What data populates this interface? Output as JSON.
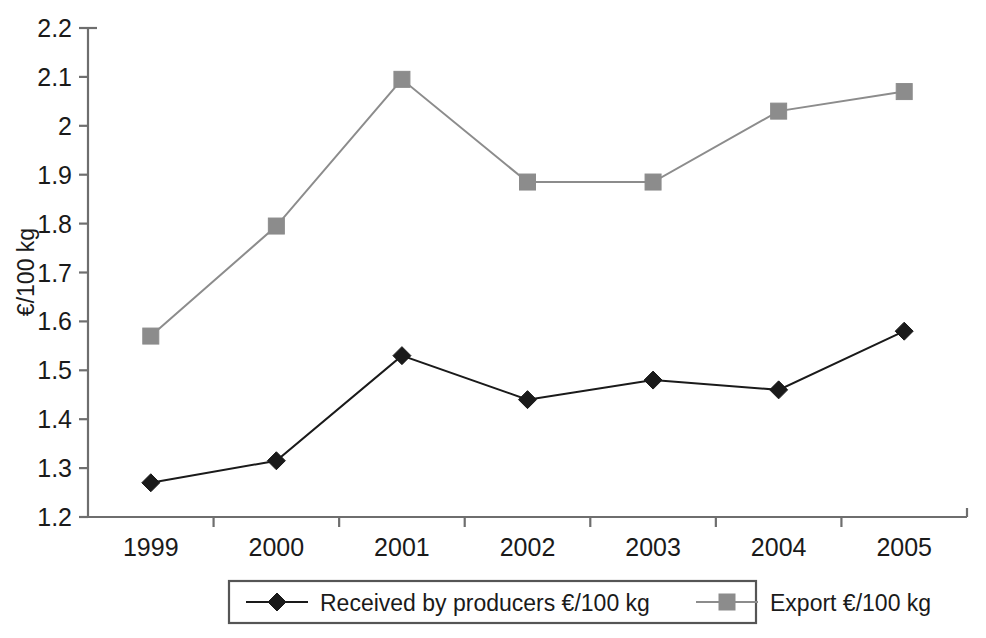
{
  "chart_data": {
    "type": "line",
    "title": "",
    "subtitle": "",
    "xlabel": "",
    "ylabel": "€/100 kg",
    "categories": [
      "1999",
      "2000",
      "2001",
      "2002",
      "2003",
      "2004",
      "2005"
    ],
    "ylim": [
      1.2,
      2.2
    ],
    "yticks": [
      "1.2",
      "1.3",
      "1.4",
      "1.5",
      "1.6",
      "1.7",
      "1.8",
      "1.9",
      "2",
      "2.1",
      "2.2"
    ],
    "ytick_values": [
      1.2,
      1.3,
      1.4,
      1.5,
      1.6,
      1.7,
      1.8,
      1.9,
      2.0,
      2.1,
      2.2
    ],
    "grid": false,
    "legend_position": "bottom",
    "series": [
      {
        "name": "Received by producers €/100 kg",
        "marker": "diamond",
        "color": "#1a1a1a",
        "values": [
          1.27,
          1.315,
          1.53,
          1.44,
          1.48,
          1.46,
          1.58
        ]
      },
      {
        "name": "Export €/100 kg",
        "marker": "square",
        "color": "#8c8c8c",
        "values": [
          1.57,
          1.795,
          2.095,
          1.885,
          1.885,
          2.03,
          2.07
        ]
      }
    ]
  },
  "legend": {
    "items": [
      {
        "label": "Received by producers €/100 kg",
        "marker": "diamond-marker",
        "color": "#1a1a1a"
      },
      {
        "label": "Export €/100 kg",
        "marker": "square-marker",
        "color": "#8c8c8c"
      }
    ]
  },
  "colors": {
    "producers": "#1a1a1a",
    "export": "#8c8c8c",
    "axis": "#6e6e6e",
    "background": "#ffffff"
  }
}
